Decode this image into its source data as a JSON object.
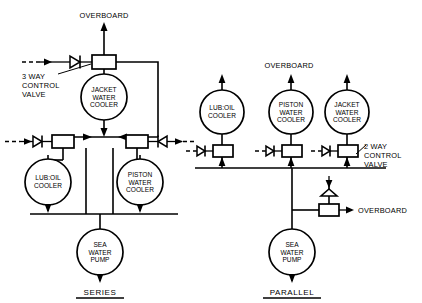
{
  "figure": {
    "type": "piping-schematic",
    "background_color": "#ffffff",
    "line_color": "#000000"
  },
  "series_circuit": {
    "title": "SERIES",
    "overboard_label": "OVERBOARD",
    "control_valve_label_lines": [
      "3 WAY",
      "CONTROL",
      "VALVE"
    ],
    "control_valve_type": "3-way",
    "coolers": [
      {
        "id": "jacket-water-cooler",
        "lines": [
          "JACKET",
          "WATER",
          "COOLER"
        ],
        "cx": 104,
        "cy": 97,
        "r": 23
      },
      {
        "id": "lub-oil-cooler",
        "lines": [
          "LUB:OIL",
          "COOLER"
        ],
        "cx": 48,
        "cy": 182,
        "r": 23
      },
      {
        "id": "piston-water-cooler",
        "lines": [
          "PISTON",
          "WATER",
          "COOLER"
        ],
        "cx": 140,
        "cy": 182,
        "r": 23
      }
    ],
    "pump": {
      "id": "sea-water-pump",
      "lines": [
        "SEA",
        "WATER",
        "PUMP"
      ],
      "cx": 100,
      "cy": 252,
      "r": 23
    },
    "valves": [
      {
        "id": "three-way-control-valve",
        "x": 92,
        "y": 55,
        "w": 24,
        "h": 14
      },
      {
        "id": "lub-oil-inlet-valve",
        "x": 52,
        "y": 135,
        "w": 22,
        "h": 13
      },
      {
        "id": "piston-water-inlet-valve",
        "x": 126,
        "y": 135,
        "w": 22,
        "h": 13
      }
    ]
  },
  "parallel_circuit": {
    "title": "PARALLEL",
    "overboard_label_top": "OVERBOARD",
    "overboard_label_relief": "OVERBOARD",
    "control_valve_label_lines": [
      "2 WAY",
      "CONTROL",
      "VALVE"
    ],
    "control_valve_type": "2-way",
    "coolers": [
      {
        "id": "lub-oil-cooler",
        "lines": [
          "LUB:OIL",
          "COOLER"
        ],
        "cx": 222,
        "cy": 112,
        "r": 22
      },
      {
        "id": "piston-water-cooler",
        "lines": [
          "PISTON",
          "WATER",
          "COOLER"
        ],
        "cx": 291,
        "cy": 112,
        "r": 22
      },
      {
        "id": "jacket-water-cooler",
        "lines": [
          "JACKET",
          "WATER",
          "COOLER"
        ],
        "cx": 347,
        "cy": 112,
        "r": 22
      }
    ],
    "pump": {
      "id": "sea-water-pump",
      "lines": [
        "SEA",
        "WATER",
        "PUMP"
      ],
      "cx": 292,
      "cy": 252,
      "r": 23
    },
    "valves": [
      {
        "id": "lub-oil-inlet-valve",
        "x": 213,
        "y": 145,
        "w": 20,
        "h": 12
      },
      {
        "id": "piston-water-inlet-valve",
        "x": 282,
        "y": 145,
        "w": 20,
        "h": 12
      },
      {
        "id": "two-way-control-valve",
        "x": 338,
        "y": 145,
        "w": 20,
        "h": 12
      },
      {
        "id": "relief-overboard-valve",
        "x": 319,
        "y": 204,
        "w": 20,
        "h": 12
      }
    ]
  }
}
